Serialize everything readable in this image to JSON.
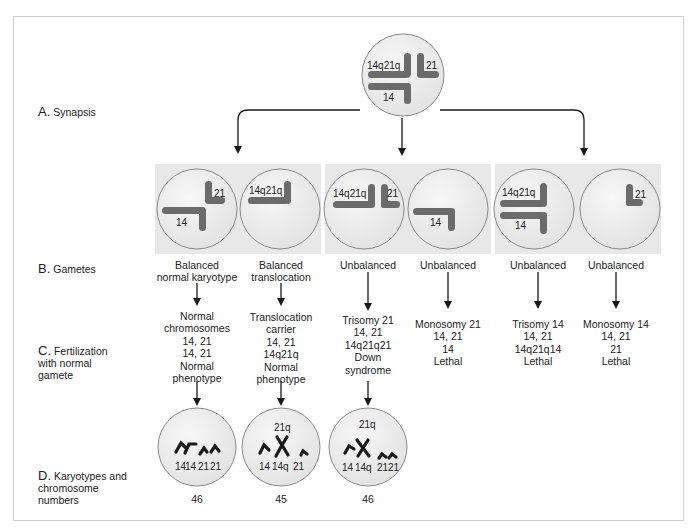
{
  "colors": {
    "panel_bg": "#e8e8e8",
    "cell_fill": "#ececec",
    "cell_stroke": "#8a8a8a",
    "chromosome": "#6b6b6b",
    "karyotype_chromosome": "#1a1a1a",
    "arrow": "#1a1a1a",
    "frame": "#cfcfcf"
  },
  "row_labels": [
    {
      "letter": "A.",
      "text": "Synapsis"
    },
    {
      "letter": "B.",
      "text": "Gametes"
    },
    {
      "letter": "C.",
      "lines": [
        "Fertilization",
        "with normal",
        "gamete"
      ]
    },
    {
      "letter": "D.",
      "lines": [
        "Karyotypes and",
        "chromosome",
        "numbers"
      ]
    }
  ],
  "synapsis_cell": {
    "labels": [
      "14q21q",
      "21",
      "14"
    ]
  },
  "gametes": [
    {
      "chromosome_labels": [
        "21",
        "14"
      ],
      "caption": [
        "Balanced",
        "normal karyotype"
      ],
      "result": [
        "Normal",
        "chromosomes",
        "14, 21",
        "14, 21",
        "Normal",
        "phenotype"
      ],
      "karyotype": {
        "top_label": "",
        "labels": [
          "14",
          "14",
          "21",
          "21"
        ],
        "number": "46"
      }
    },
    {
      "chromosome_labels": [
        "14q21q"
      ],
      "caption": [
        "Balanced",
        "translocation"
      ],
      "result": [
        "Translocation",
        "carrier",
        "14, 21",
        "14q21q",
        "Normal",
        "phenotype"
      ],
      "karyotype": {
        "top_label": "21q",
        "labels": [
          "14",
          "14q",
          "21"
        ],
        "number": "45"
      }
    },
    {
      "chromosome_labels": [
        "14q21q",
        "21"
      ],
      "caption": [
        "Unbalanced"
      ],
      "result": [
        "Trisomy 21",
        "14, 21",
        "14q21q21",
        "Down",
        "syndrome"
      ],
      "karyotype": {
        "top_label": "21q",
        "labels": [
          "14",
          "14q",
          "21",
          "21"
        ],
        "number": "46"
      }
    },
    {
      "chromosome_labels": [
        "14"
      ],
      "caption": [
        "Unbalanced"
      ],
      "result": [
        "Monosomy 21",
        "14, 21",
        "14",
        "Lethal"
      ]
    },
    {
      "chromosome_labels": [
        "14q21q",
        "14"
      ],
      "caption": [
        "Unbalanced"
      ],
      "result": [
        "Trisomy 14",
        "14, 21",
        "14q21q14",
        "Lethal"
      ]
    },
    {
      "chromosome_labels": [
        "21"
      ],
      "caption": [
        "Unbalanced"
      ],
      "result": [
        "Monosomy 14",
        "14, 21",
        "21",
        "Lethal"
      ]
    }
  ]
}
